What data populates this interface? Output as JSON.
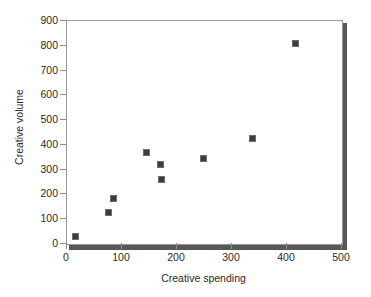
{
  "chart_data": {
    "type": "scatter",
    "title": "",
    "xlabel": "Creative spending",
    "ylabel": "Creative volume",
    "xlim": [
      0,
      500
    ],
    "ylim": [
      0,
      900
    ],
    "xticks": [
      0,
      100,
      200,
      300,
      400,
      500
    ],
    "yticks": [
      0,
      100,
      200,
      300,
      400,
      500,
      600,
      700,
      800,
      900
    ],
    "grid": false,
    "legend": null,
    "marker": "square",
    "marker_color": "#3c3c3c",
    "points": [
      {
        "x": 15,
        "y": 30
      },
      {
        "x": 75,
        "y": 128
      },
      {
        "x": 85,
        "y": 185
      },
      {
        "x": 145,
        "y": 368
      },
      {
        "x": 170,
        "y": 322
      },
      {
        "x": 172,
        "y": 260
      },
      {
        "x": 248,
        "y": 347
      },
      {
        "x": 338,
        "y": 425
      },
      {
        "x": 415,
        "y": 811
      }
    ]
  },
  "axis_colors": {
    "frame": "#9a9a9a",
    "shadow": "#585858",
    "text": "#2a2a2a"
  }
}
